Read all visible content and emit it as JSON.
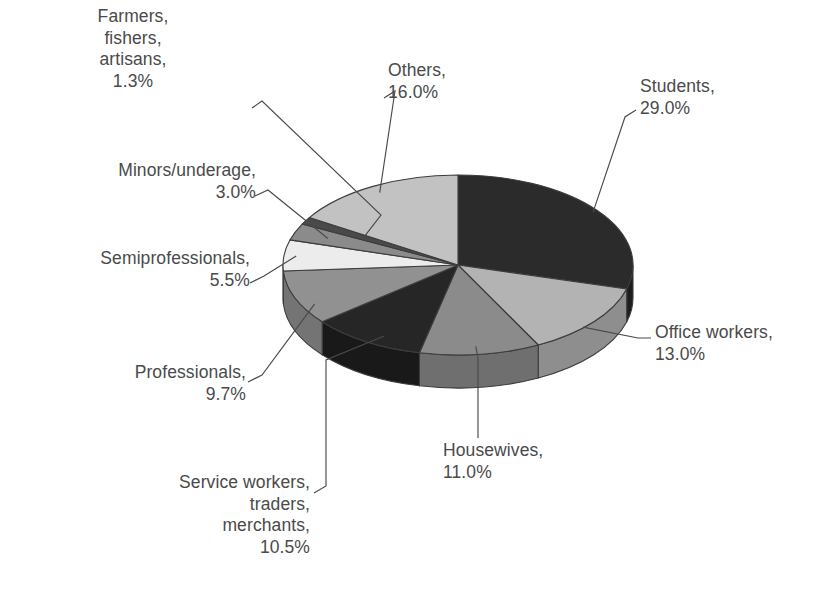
{
  "chart_data": {
    "type": "pie",
    "title": "",
    "subtitle": "",
    "xlabel": "",
    "ylabel": "",
    "legend_position": "none",
    "style": "3d-exploded-none-grayscale",
    "units": "percent",
    "categories": [
      "Students",
      "Office workers",
      "Housewives",
      "Service workers, traders, merchants",
      "Professionals",
      "Semiprofessionals",
      "Minors/underage",
      "Farmers, fishers, artisans",
      "Others"
    ],
    "values": [
      29.0,
      13.0,
      11.0,
      10.5,
      9.7,
      5.5,
      3.0,
      1.3,
      16.0
    ],
    "total": 100.0,
    "slices": [
      {
        "label": "Students",
        "value": 29.0,
        "value_text": "29.0%",
        "color": "#2b2b2b",
        "side_color": "#1d1d1d"
      },
      {
        "label": "Office workers",
        "value": 13.0,
        "value_text": "13.0%",
        "color": "#b3b3b3",
        "side_color": "#8e8e8e"
      },
      {
        "label": "Housewives",
        "value": 11.0,
        "value_text": "11.0%",
        "color": "#8b8b8b",
        "side_color": "#6f6f6f"
      },
      {
        "label": "Service workers, traders, merchants",
        "value": 10.5,
        "value_text": "10.5%",
        "color": "#262626",
        "side_color": "#191919"
      },
      {
        "label": "Professionals",
        "value": 9.7,
        "value_text": "9.7%",
        "color": "#919191",
        "side_color": "#747474"
      },
      {
        "label": "Semiprofessionals",
        "value": 5.5,
        "value_text": "5.5%",
        "color": "#ececec",
        "side_color": "#bdbdbd"
      },
      {
        "label": "Minors/underage",
        "value": 3.0,
        "value_text": "3.0%",
        "color": "#8b8b8b",
        "side_color": "#6f6f6f"
      },
      {
        "label": "Farmers, fishers, artisans",
        "value": 1.3,
        "value_text": "1.3%",
        "color": "#4a4a4a",
        "side_color": "#3a3a3a"
      },
      {
        "label": "Others",
        "value": 16.0,
        "value_text": "16.0%",
        "color": "#c2c2c2",
        "side_color": "#9b9b9b"
      }
    ]
  },
  "labels": {
    "farmers": {
      "lines": [
        "Farmers,",
        "fishers,",
        "artisans,",
        "1.3%"
      ]
    },
    "minors": {
      "lines": [
        "Minors/underage,",
        "3.0%"
      ]
    },
    "semiprofessionals": {
      "lines": [
        "Semiprofessionals,",
        "5.5%"
      ]
    },
    "professionals": {
      "lines": [
        "Professionals,",
        "9.7%"
      ]
    },
    "service": {
      "lines": [
        "Service workers,",
        "traders,",
        "merchants,",
        "10.5%"
      ]
    },
    "housewives": {
      "lines": [
        "Housewives,",
        "11.0%"
      ]
    },
    "office": {
      "lines": [
        "Office workers,",
        "13.0%"
      ]
    },
    "students": {
      "lines": [
        "Students,",
        "29.0%"
      ]
    },
    "others": {
      "lines": [
        "Others,",
        "16.0%"
      ]
    }
  },
  "geometry": {
    "cx": 458,
    "cy": 265,
    "rx": 175,
    "ry": 90,
    "depth": 33,
    "start_angle_deg": -90,
    "direction": "clockwise"
  },
  "colors": {
    "background": "#ffffff",
    "outline": "#3c3c3c",
    "leader_line": "#4a4a4a",
    "text": "#4a4a4a"
  }
}
